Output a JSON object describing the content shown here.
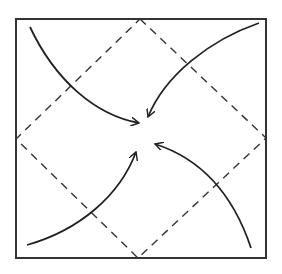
{
  "diagram": {
    "type": "origami-fold-instruction",
    "description": "Fold all four corners of the square to the center",
    "colors": {
      "background": "#ffffff",
      "stroke": "#222222",
      "dashed": "#333333"
    },
    "square": {
      "x1": 16,
      "y1": 19,
      "x2": 266,
      "y2": 258,
      "label": "paper-square"
    },
    "fold_lines": {
      "style": "dashed",
      "points": [
        [
          140,
          19
        ],
        [
          266,
          138
        ],
        [
          138,
          258
        ],
        [
          16,
          139
        ]
      ],
      "label": "valley-fold-lines"
    },
    "arrows": [
      {
        "name": "top-left-corner-arrow",
        "path": "M30,27 C55,80 95,115 139,123",
        "tip": [
          139,
          123
        ],
        "direction": "to-center"
      },
      {
        "name": "top-right-corner-arrow",
        "path": "M259,23 C210,40 165,75 148,117",
        "tip": [
          148,
          117
        ],
        "direction": "to-center"
      },
      {
        "name": "bottom-left-corner-arrow",
        "path": "M27,245 C80,230 120,195 136,152",
        "tip": [
          136,
          152
        ],
        "direction": "to-center"
      },
      {
        "name": "bottom-right-corner-arrow",
        "path": "M251,248 C235,200 205,160 155,144",
        "tip": [
          155,
          144
        ],
        "direction": "to-center"
      }
    ]
  }
}
